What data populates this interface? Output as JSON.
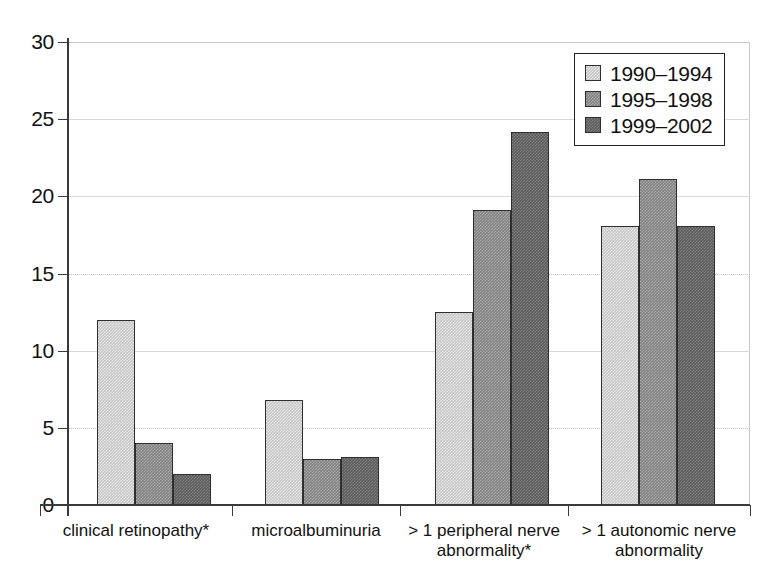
{
  "chart_data": {
    "type": "bar",
    "title": "",
    "xlabel": "",
    "ylabel": "",
    "ylim": [
      0,
      30
    ],
    "yticks": [
      0,
      5,
      10,
      15,
      20,
      25,
      30
    ],
    "ytick_labels": [
      "0",
      "5",
      "10",
      "15",
      "20",
      "25",
      "30"
    ],
    "grid": true,
    "legend_position": "top-right",
    "categories": [
      "clinical retinopathy*",
      "microalbuminuria",
      "> 1 peripheral nerve abnormality*",
      "> 1 autonomic nerve abnormality"
    ],
    "category_lines": [
      [
        "clinical retinopathy*"
      ],
      [
        "microalbuminuria"
      ],
      [
        "> 1 peripheral nerve",
        "abnormality*"
      ],
      [
        "> 1 autonomic nerve",
        "abnormality"
      ]
    ],
    "series": [
      {
        "name": "1990–1994",
        "color": "#c6c6c6",
        "values": [
          12.0,
          6.8,
          12.5,
          18.1
        ]
      },
      {
        "name": "1995–1998",
        "color": "#828282",
        "values": [
          4.0,
          3.0,
          19.1,
          21.1
        ]
      },
      {
        "name": "1999–2002",
        "color": "#5c5c5c",
        "values": [
          2.0,
          3.1,
          24.2,
          18.1
        ]
      }
    ]
  },
  "axis": {
    "y_labels": [
      "30",
      "25",
      "20",
      "15",
      "10",
      "5",
      "0"
    ]
  },
  "legend": {
    "items": [
      {
        "label": "1990–1994"
      },
      {
        "label": "1995–1998"
      },
      {
        "label": "1999–2002"
      }
    ]
  }
}
